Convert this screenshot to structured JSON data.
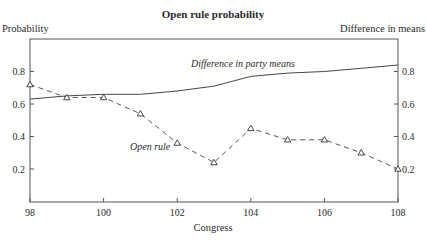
{
  "chart_data": {
    "type": "line",
    "title": "Open rule probability",
    "xlabel": "Congress",
    "ylabel_left": "Probability",
    "ylabel_right": "Difference in means",
    "x": [
      98,
      99,
      100,
      101,
      102,
      103,
      104,
      105,
      106,
      107,
      108
    ],
    "xlim": [
      98,
      108
    ],
    "xticks": [
      98,
      100,
      102,
      104,
      106,
      108
    ],
    "ylim": [
      0,
      1.0
    ],
    "yticks_left": [
      0.2,
      0.4,
      0.6,
      0.8
    ],
    "yticks_right": [
      0.2,
      0.4,
      0.6,
      0.8
    ],
    "grid": false,
    "legend": "inline labels",
    "series": [
      {
        "name": "Difference in party means",
        "label": "Difference in party means",
        "style": "solid",
        "axis": "right",
        "marker": "none",
        "values": [
          0.63,
          0.65,
          0.66,
          0.66,
          0.68,
          0.71,
          0.77,
          0.79,
          0.8,
          0.82,
          0.84
        ]
      },
      {
        "name": "Open rule",
        "label": "Open rule",
        "style": "dashed",
        "axis": "left",
        "marker": "triangle",
        "values": [
          0.72,
          0.64,
          0.64,
          0.54,
          0.36,
          0.24,
          0.45,
          0.38,
          0.38,
          0.3,
          0.2
        ]
      }
    ],
    "colors": {
      "line": "#444444",
      "axis": "#555555",
      "text": "#2b2b2b"
    }
  }
}
